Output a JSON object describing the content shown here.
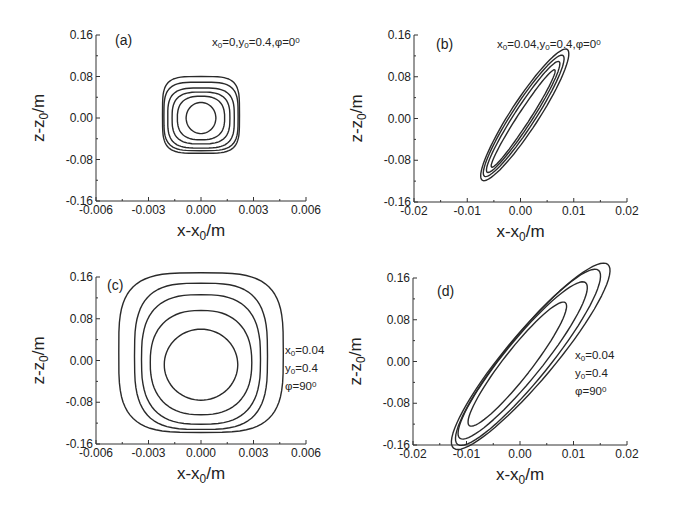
{
  "figure": {
    "panels": [
      {
        "id": "a",
        "label": "(a)",
        "annotation": [
          "x₀=0,y₀=0.4,φ=0°"
        ],
        "xlabel": "x-x₀/m",
        "ylabel": "z-z₀/m",
        "xticks": [
          "-0.006",
          "-0.003",
          "0.000",
          "0.003",
          "0.006"
        ],
        "yticks": [
          "0.16",
          "0.08",
          "0.00",
          "-0.08",
          "-0.16"
        ]
      },
      {
        "id": "b",
        "label": "(b)",
        "annotation": [
          "x₀=0.04,y₀=0.4,φ=0°"
        ],
        "xlabel": "x-x₀/m",
        "ylabel": "z-z₀/m",
        "xticks": [
          "-0.02",
          "-0.01",
          "0.00",
          "0.01",
          "0.02"
        ],
        "yticks": [
          "0.16",
          "0.08",
          "0.00",
          "-0.08",
          "-0.16"
        ]
      },
      {
        "id": "c",
        "label": "(c)",
        "annotation": [
          "x₀=0.04",
          "y₀=0.4",
          "φ=90°"
        ],
        "xlabel": "x-x₀/m",
        "ylabel": "z-z₀/m",
        "xticks": [
          "-0.006",
          "-0.003",
          "0.000",
          "0.003",
          "0.006"
        ],
        "yticks": [
          "0.16",
          "0.08",
          "0.00",
          "-0.08",
          "-0.16"
        ]
      },
      {
        "id": "d",
        "label": "(d)",
        "annotation": [
          "x₀=0.04",
          "y₀=0.4",
          "φ=90°"
        ],
        "xlabel": "x-x₀/m",
        "ylabel": "z-z₀/m",
        "xticks": [
          "-0.02",
          "-0.01",
          "0.00",
          "0.01",
          "0.02"
        ],
        "yticks": [
          "0.16",
          "0.08",
          "0.00",
          "-0.08",
          "-0.16"
        ]
      }
    ]
  },
  "chart_data": [
    {
      "type": "contour",
      "title": "(a) x0=0, y0=0.4, phi=0 deg",
      "xlabel": "x-x0/m",
      "ylabel": "z-z0/m",
      "xlim": [
        -0.006,
        0.006
      ],
      "ylim": [
        -0.16,
        0.16
      ],
      "contours": [
        {
          "shape": "superellipse",
          "cx": 0.0,
          "cz": 0.0,
          "rx": 0.00085,
          "rz": 0.03,
          "n": 2.0,
          "tilt": 0
        },
        {
          "shape": "superellipse",
          "cx": 0.0,
          "cz": 0.0,
          "rx": 0.00135,
          "rz": 0.042,
          "n": 2.6,
          "tilt": 0
        },
        {
          "shape": "superellipse",
          "cx": 0.0,
          "cz": 0.0,
          "rx": 0.00165,
          "rz": 0.05,
          "n": 3.0,
          "tilt": 0
        },
        {
          "shape": "superellipse",
          "cx": 0.0,
          "cz": 0.0,
          "rx": 0.0019,
          "rz": 0.058,
          "n": 3.4,
          "tilt": 0
        },
        {
          "shape": "superellipse",
          "cx": 0.0,
          "cz": 0.003,
          "rx": 0.00212,
          "rz": 0.066,
          "n": 3.8,
          "tilt": 0
        },
        {
          "shape": "superellipse",
          "cx": 0.0,
          "cz": 0.006,
          "rx": 0.0022,
          "rz": 0.074,
          "n": 4.2,
          "tilt": 0
        }
      ]
    },
    {
      "type": "contour",
      "title": "(b) x0=0.04, y0=0.4, phi=0 deg",
      "xlabel": "x-x0/m",
      "ylabel": "z-z0/m",
      "xlim": [
        -0.02,
        0.02
      ],
      "ylim": [
        -0.16,
        0.16
      ],
      "contours": [
        {
          "shape": "tilted-ellipse",
          "cx": 0.0005,
          "cz": 0.0,
          "major": 58,
          "minor": 6,
          "angle_deg": 57
        },
        {
          "shape": "tilted-ellipse",
          "cx": 0.0005,
          "cz": 0.003,
          "major": 66,
          "minor": 9,
          "angle_deg": 57
        },
        {
          "shape": "tilted-ellipse",
          "cx": 0.0006,
          "cz": 0.005,
          "major": 72,
          "minor": 11.5,
          "angle_deg": 57
        },
        {
          "shape": "tilted-ellipse",
          "cx": 0.0008,
          "cz": 0.007,
          "major": 78,
          "minor": 14,
          "angle_deg": 57
        }
      ]
    },
    {
      "type": "contour",
      "title": "(c) x0=0.04, y0=0.4, phi=90 deg",
      "xlabel": "x-x0/m",
      "ylabel": "z-z0/m",
      "xlim": [
        -0.006,
        0.006
      ],
      "ylim": [
        -0.16,
        0.16
      ],
      "contours": [
        {
          "shape": "superellipse",
          "cx": 0.0,
          "cz": -0.008,
          "rx": 0.0021,
          "rz": 0.068,
          "n": 2.0,
          "tilt": 0
        },
        {
          "shape": "superellipse",
          "cx": 0.0,
          "cz": -0.004,
          "rx": 0.0029,
          "rz": 0.1,
          "n": 2.4,
          "tilt": 0
        },
        {
          "shape": "superellipse",
          "cx": 0.0,
          "cz": 0.002,
          "rx": 0.0034,
          "rz": 0.124,
          "n": 2.8,
          "tilt": 0
        },
        {
          "shape": "superellipse",
          "cx": 0.0,
          "cz": 0.008,
          "rx": 0.0038,
          "rz": 0.14,
          "n": 3.2,
          "tilt": 0
        },
        {
          "shape": "superellipse",
          "cx": 0.0,
          "cz": 0.015,
          "rx": 0.0047,
          "rz": 0.153,
          "n": 3.6,
          "tilt": 0
        }
      ]
    },
    {
      "type": "contour",
      "title": "(d) x0=0.04, y0=0.4, phi=90 deg",
      "xlabel": "x-x0/m",
      "ylabel": "z-z0/m",
      "xlim": [
        -0.02,
        0.02
      ],
      "ylim": [
        -0.16,
        0.16
      ],
      "contours": [
        {
          "shape": "tilted-ellipse",
          "cx": -0.0005,
          "cz": -0.005,
          "major": 78,
          "minor": 14,
          "angle_deg": 52
        },
        {
          "shape": "tilted-ellipse",
          "cx": 0.0005,
          "cz": 0.002,
          "major": 100,
          "minor": 19,
          "angle_deg": 51
        },
        {
          "shape": "tilted-ellipse",
          "cx": 0.0015,
          "cz": 0.008,
          "major": 112,
          "minor": 22,
          "angle_deg": 51
        },
        {
          "shape": "tilted-ellipse",
          "cx": 0.002,
          "cz": 0.01,
          "major": 120,
          "minor": 24,
          "angle_deg": 50
        }
      ]
    }
  ]
}
